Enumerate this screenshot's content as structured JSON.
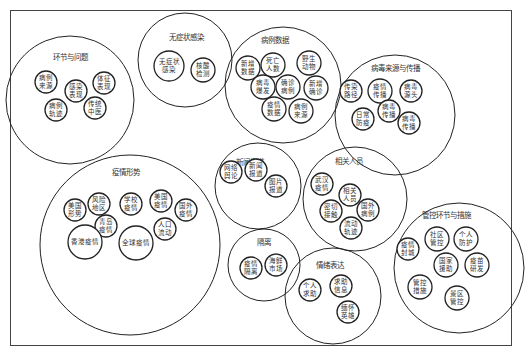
{
  "diagram": {
    "type": "circle-packing",
    "groups": [
      {
        "id": "g1",
        "title": "环节与问题",
        "cx": 70,
        "cy": 100,
        "r": 64,
        "tx": 70,
        "ty": 60,
        "items": [
          {
            "lines": [
              "病例",
              "来源"
            ],
            "cx": 46,
            "cy": 82,
            "r": 11
          },
          {
            "lines": [
              "感染",
              "表现"
            ],
            "cx": 76,
            "cy": 91,
            "r": 11
          },
          {
            "lines": [
              "体征",
              "表现"
            ],
            "cx": 104,
            "cy": 83,
            "r": 11
          },
          {
            "lines": [
              "病例",
              "轨迹"
            ],
            "cx": 56,
            "cy": 110,
            "r": 11
          },
          {
            "lines": [
              "传统",
              "中医"
            ],
            "cx": 95,
            "cy": 108,
            "r": 11
          }
        ]
      },
      {
        "id": "g2",
        "title": "无症状感染",
        "cx": 185,
        "cy": 60,
        "r": 47,
        "tx": 186,
        "ty": 40,
        "items": [
          {
            "lines": [
              "无症状",
              "感染"
            ],
            "cx": 169,
            "cy": 66,
            "r": 15
          },
          {
            "lines": [
              "核酸",
              "检测"
            ],
            "cx": 203,
            "cy": 70,
            "r": 12
          }
        ]
      },
      {
        "id": "g3",
        "title": "病例数据",
        "cx": 283,
        "cy": 85,
        "r": 58,
        "tx": 275,
        "ty": 43,
        "items": [
          {
            "lines": [
              "新增",
              "数据"
            ],
            "cx": 248,
            "cy": 68,
            "r": 12
          },
          {
            "lines": [
              "死亡",
              "人数"
            ],
            "cx": 273,
            "cy": 65,
            "r": 12
          },
          {
            "lines": [
              "野生",
              "动物"
            ],
            "cx": 309,
            "cy": 63,
            "r": 12
          },
          {
            "lines": [
              "病毒",
              "爆发"
            ],
            "cx": 263,
            "cy": 87,
            "r": 12
          },
          {
            "lines": [
              "确诊",
              "病例"
            ],
            "cx": 288,
            "cy": 87,
            "r": 12
          },
          {
            "lines": [
              "新增",
              "确诊"
            ],
            "cx": 316,
            "cy": 88,
            "r": 12
          },
          {
            "lines": [
              "疫情",
              "数据"
            ],
            "cx": 274,
            "cy": 109,
            "r": 12
          },
          {
            "lines": [
              "病例",
              "来源"
            ],
            "cx": 301,
            "cy": 111,
            "r": 12
          }
        ]
      },
      {
        "id": "g4",
        "title": "病毒来源与传播",
        "cx": 395,
        "cy": 115,
        "r": 60,
        "tx": 395,
        "ty": 71,
        "items": [
          {
            "lines": [
              "传染",
              "路径"
            ],
            "cx": 351,
            "cy": 91,
            "r": 11
          },
          {
            "lines": [
              "疫情",
              "传播"
            ],
            "cx": 380,
            "cy": 91,
            "r": 12
          },
          {
            "lines": [
              "病毒",
              "源头"
            ],
            "cx": 411,
            "cy": 91,
            "r": 11
          },
          {
            "lines": [
              "日常",
              "防疫"
            ],
            "cx": 363,
            "cy": 119,
            "r": 11
          },
          {
            "lines": [
              "病毒",
              "传播"
            ],
            "cx": 389,
            "cy": 111,
            "r": 11
          },
          {
            "lines": [
              "病毒",
              "传播"
            ],
            "cx": 409,
            "cy": 123,
            "r": 11
          }
        ]
      },
      {
        "id": "g5",
        "title": "疫情形势",
        "cx": 130,
        "cy": 245,
        "r": 90,
        "tx": 126,
        "ty": 175,
        "items": [
          {
            "lines": [
              "美国",
              "形势"
            ],
            "cx": 75,
            "cy": 210,
            "r": 11
          },
          {
            "lines": [
              "风险",
              "地区"
            ],
            "cx": 99,
            "cy": 204,
            "r": 11
          },
          {
            "lines": [
              "学校",
              "疫情"
            ],
            "cx": 131,
            "cy": 204,
            "r": 11
          },
          {
            "lines": [
              "美国",
              "疫情"
            ],
            "cx": 161,
            "cy": 201,
            "r": 11
          },
          {
            "lines": [
              "国外",
              "疫情"
            ],
            "cx": 186,
            "cy": 210,
            "r": 11
          },
          {
            "lines": [
              "青岛",
              "疫情"
            ],
            "cx": 106,
            "cy": 226,
            "r": 11
          },
          {
            "lines": [
              "人口",
              "流动"
            ],
            "cx": 165,
            "cy": 229,
            "r": 11
          },
          {
            "lines": [
              "香港疫情"
            ],
            "cx": 85,
            "cy": 242,
            "r": 17
          },
          {
            "lines": [
              "全球疫情"
            ],
            "cx": 136,
            "cy": 243,
            "r": 17
          }
        ]
      },
      {
        "id": "g6",
        "title": "新闻报道",
        "cx": 258,
        "cy": 186,
        "r": 43,
        "tx": 250,
        "ty": 165,
        "items": [
          {
            "lines": [
              "网络",
              "舆论"
            ],
            "cx": 231,
            "cy": 172,
            "r": 11
          },
          {
            "lines": [
              "新闻",
              "报道"
            ],
            "cx": 256,
            "cy": 170,
            "r": 11
          },
          {
            "lines": [
              "图片",
              "报道"
            ],
            "cx": 276,
            "cy": 186,
            "r": 11
          }
        ]
      },
      {
        "id": "g7",
        "title": "相关人员",
        "cx": 355,
        "cy": 199,
        "r": 52,
        "tx": 349,
        "ty": 164,
        "items": [
          {
            "lines": [
              "武汉",
              "疫情"
            ],
            "cx": 322,
            "cy": 184,
            "r": 11
          },
          {
            "lines": [
              "相关",
              "人员"
            ],
            "cx": 350,
            "cy": 195,
            "r": 11
          },
          {
            "lines": [
              "密切",
              "接触"
            ],
            "cx": 331,
            "cy": 211,
            "r": 11
          },
          {
            "lines": [
              "国外",
              "病例"
            ],
            "cx": 368,
            "cy": 210,
            "r": 11
          },
          {
            "lines": [
              "流动",
              "轨迹"
            ],
            "cx": 351,
            "cy": 228,
            "r": 11
          }
        ]
      },
      {
        "id": "g8",
        "title": "管控环节与措施",
        "cx": 459,
        "cy": 268,
        "r": 65,
        "tx": 446,
        "ty": 218,
        "items": [
          {
            "lines": [
              "疫情",
              "封城"
            ],
            "cx": 408,
            "cy": 249,
            "r": 11
          },
          {
            "lines": [
              "社区",
              "管控"
            ],
            "cx": 437,
            "cy": 239,
            "r": 12
          },
          {
            "lines": [
              "个人",
              "防护"
            ],
            "cx": 466,
            "cy": 239,
            "r": 12
          },
          {
            "lines": [
              "国家",
              "援助"
            ],
            "cx": 446,
            "cy": 265,
            "r": 12
          },
          {
            "lines": [
              "疫苗",
              "研发"
            ],
            "cx": 477,
            "cy": 265,
            "r": 12
          },
          {
            "lines": [
              "管控",
              "措施"
            ],
            "cx": 420,
            "cy": 287,
            "r": 12
          },
          {
            "lines": [
              "景区",
              "管控"
            ],
            "cx": 457,
            "cy": 298,
            "r": 12
          }
        ]
      },
      {
        "id": "g9",
        "title": "隔离",
        "cx": 264,
        "cy": 265,
        "r": 36,
        "tx": 264,
        "ty": 245,
        "items": [
          {
            "lines": [
              "疫情",
              "隔离"
            ],
            "cx": 251,
            "cy": 268,
            "r": 11
          },
          {
            "lines": [
              "海鲜",
              "市场"
            ],
            "cx": 276,
            "cy": 265,
            "r": 11
          }
        ]
      },
      {
        "id": "g10",
        "title": "情绪表达",
        "cx": 333,
        "cy": 296,
        "r": 48,
        "tx": 330,
        "ty": 268,
        "items": [
          {
            "lines": [
              "个人",
              "求助"
            ],
            "cx": 310,
            "cy": 290,
            "r": 11
          },
          {
            "lines": [
              "求助",
              "信息"
            ],
            "cx": 341,
            "cy": 286,
            "r": 11
          },
          {
            "lines": [
              "缅怀",
              "英雄"
            ],
            "cx": 348,
            "cy": 312,
            "r": 11
          }
        ]
      }
    ]
  }
}
